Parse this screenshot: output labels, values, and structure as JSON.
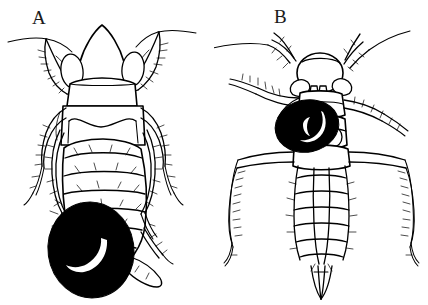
{
  "figure": {
    "kind": "scientific-line-drawing",
    "background_color": "#ffffff",
    "ink_color": "#000000",
    "width": 428,
    "height": 305,
    "panels": [
      {
        "label": "A",
        "subject": "dorsal view of an insect with a parasitic mite attached to the left side of the abdomen",
        "mite": {
          "fill_color": "#000000",
          "highlight_color": "#ffffff",
          "highlight_shape": "crescent"
        }
      },
      {
        "label": "B",
        "subject": "dorsal view of a slender insect with a parasitic mite attached to the left side of the thorax",
        "mite": {
          "fill_color": "#000000",
          "highlight_color": "#ffffff",
          "highlight_shape": "crescent"
        }
      }
    ]
  }
}
